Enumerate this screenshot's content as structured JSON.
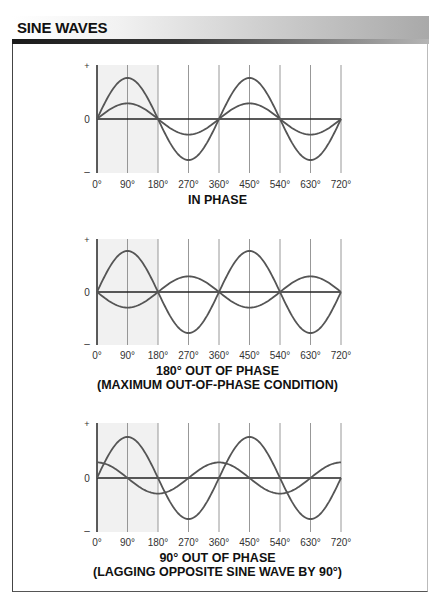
{
  "header": {
    "title": "SINE WAVES"
  },
  "axis_labels": {
    "plus": "+",
    "zero": "0",
    "minus": "–"
  },
  "x_ticks": [
    "0°",
    "90°",
    "180°",
    "270°",
    "360°",
    "450°",
    "540°",
    "630°",
    "720°"
  ],
  "panels": [
    {
      "caption_line1": "IN PHASE",
      "caption_line2": ""
    },
    {
      "caption_line1": "180° OUT OF PHASE",
      "caption_line2": "(MAXIMUM OUT-OF-PHASE CONDITION)"
    },
    {
      "caption_line1": "90° OUT OF PHASE",
      "caption_line2": "(LAGGING OPPOSITE SINE WAVE BY 90°)"
    }
  ],
  "chart_data": [
    {
      "type": "line",
      "title": "IN PHASE",
      "x": [
        0,
        90,
        180,
        270,
        360,
        450,
        540,
        630,
        720
      ],
      "series": [
        {
          "name": "large wave",
          "amplitude": 1.0,
          "phase_deg": 0
        },
        {
          "name": "small wave",
          "amplitude": 0.38,
          "phase_deg": 0
        }
      ]
    },
    {
      "type": "line",
      "title": "180° OUT OF PHASE",
      "x": [
        0,
        90,
        180,
        270,
        360,
        450,
        540,
        630,
        720
      ],
      "series": [
        {
          "name": "large wave",
          "amplitude": 1.0,
          "phase_deg": 0
        },
        {
          "name": "small wave",
          "amplitude": 0.38,
          "phase_deg": 180
        }
      ]
    },
    {
      "type": "line",
      "title": "90° OUT OF PHASE",
      "x": [
        0,
        90,
        180,
        270,
        360,
        450,
        540,
        630,
        720
      ],
      "series": [
        {
          "name": "large wave",
          "amplitude": 1.0,
          "phase_deg": 0
        },
        {
          "name": "small wave",
          "amplitude": 0.38,
          "phase_deg": 90
        }
      ]
    }
  ]
}
